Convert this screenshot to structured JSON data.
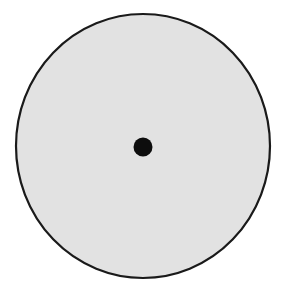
{
  "diagram": {
    "shape": "circle-with-center-dot",
    "background": "#ffffff",
    "circle": {
      "cx": 143,
      "cy": 146,
      "rx": 127,
      "ry": 132,
      "fill": "#e2e2e2",
      "stroke": "#1a1a1a",
      "stroke_width": 2.2
    },
    "center_dot": {
      "cx": 143,
      "cy": 147,
      "r": 9.5,
      "fill": "#0d0d0d"
    }
  }
}
